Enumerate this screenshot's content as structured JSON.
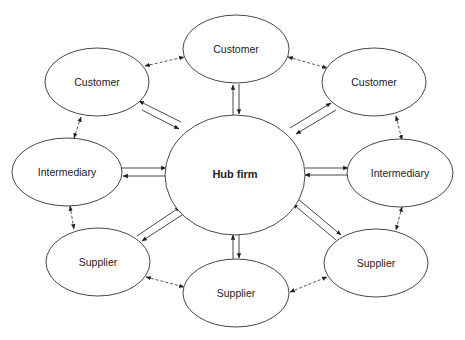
{
  "diagram": {
    "type": "hub-and-spoke network",
    "hub": {
      "id": "hub",
      "label": "Hub firm",
      "cx": 235,
      "cy": 175,
      "rx": 70,
      "ry": 60
    },
    "nodes": [
      {
        "id": "customer_top",
        "label": "Customer",
        "cx": 236,
        "cy": 49,
        "rx": 53,
        "ry": 34
      },
      {
        "id": "customer_left",
        "label": "Customer",
        "cx": 97,
        "cy": 82,
        "rx": 52,
        "ry": 34
      },
      {
        "id": "customer_right",
        "label": "Customer",
        "cx": 374,
        "cy": 82,
        "rx": 52,
        "ry": 34
      },
      {
        "id": "intermediary_left",
        "label": "Intermediary",
        "cx": 67,
        "cy": 172,
        "rx": 55,
        "ry": 34
      },
      {
        "id": "intermediary_right",
        "label": "Intermediary",
        "cx": 400,
        "cy": 173,
        "rx": 53,
        "ry": 34
      },
      {
        "id": "supplier_left",
        "label": "Supplier",
        "cx": 98,
        "cy": 262,
        "rx": 52,
        "ry": 34
      },
      {
        "id": "supplier_bottom",
        "label": "Supplier",
        "cx": 236,
        "cy": 293,
        "rx": 53,
        "ry": 34
      },
      {
        "id": "supplier_right",
        "label": "Supplier",
        "cx": 376,
        "cy": 263,
        "rx": 52,
        "ry": 34
      }
    ],
    "hub_links": [
      {
        "node": "customer_top",
        "style": "solid",
        "direction": "bidirectional-pair"
      },
      {
        "node": "customer_left",
        "style": "solid",
        "direction": "bidirectional-pair"
      },
      {
        "node": "customer_right",
        "style": "solid",
        "direction": "bidirectional-pair"
      },
      {
        "node": "intermediary_left",
        "style": "solid",
        "direction": "bidirectional-pair"
      },
      {
        "node": "intermediary_right",
        "style": "solid",
        "direction": "bidirectional-pair"
      },
      {
        "node": "supplier_left",
        "style": "solid",
        "direction": "bidirectional-pair"
      },
      {
        "node": "supplier_bottom",
        "style": "solid",
        "direction": "bidirectional-pair"
      },
      {
        "node": "supplier_right",
        "style": "solid",
        "direction": "bidirectional-pair"
      }
    ],
    "peer_links": [
      {
        "from": "customer_left",
        "to": "customer_top",
        "style": "dashed",
        "direction": "double-headed"
      },
      {
        "from": "customer_top",
        "to": "customer_right",
        "style": "dashed",
        "direction": "double-headed"
      },
      {
        "from": "customer_left",
        "to": "intermediary_left",
        "style": "dashed",
        "direction": "double-headed"
      },
      {
        "from": "customer_right",
        "to": "intermediary_right",
        "style": "dashed",
        "direction": "double-headed"
      },
      {
        "from": "intermediary_left",
        "to": "supplier_left",
        "style": "dashed",
        "direction": "double-headed"
      },
      {
        "from": "intermediary_right",
        "to": "supplier_right",
        "style": "dashed",
        "direction": "double-headed"
      },
      {
        "from": "supplier_left",
        "to": "supplier_bottom",
        "style": "dashed",
        "direction": "double-headed"
      },
      {
        "from": "supplier_bottom",
        "to": "supplier_right",
        "style": "dashed",
        "direction": "double-headed"
      }
    ]
  },
  "labels": {
    "hub": "Hub firm",
    "customer_top": "Customer",
    "customer_left": "Customer",
    "customer_right": "Customer",
    "intermediary_left": "Intermediary",
    "intermediary_right": "Intermediary",
    "supplier_left": "Supplier",
    "supplier_bottom": "Supplier",
    "supplier_right": "Supplier"
  }
}
